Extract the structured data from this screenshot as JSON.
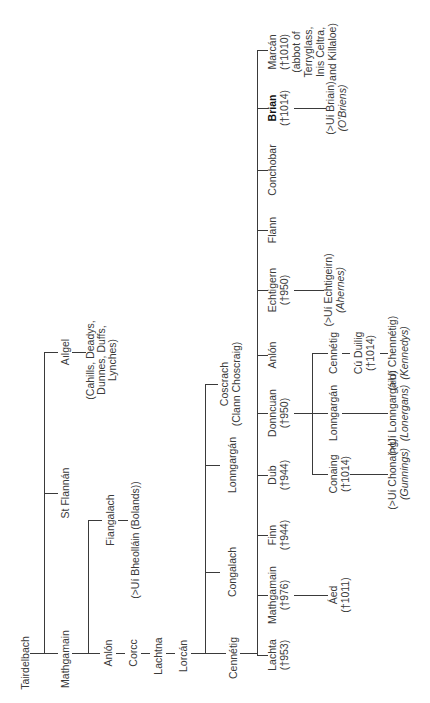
{
  "diagram": {
    "type": "family-tree",
    "orientation": "rotated 90 degrees counter-clockwise",
    "line_color": "#3a3a3a",
    "text_color": "#3a3a3a",
    "background": "#ffffff"
  },
  "nodes": {
    "tairdelbach": {
      "name": "Tairdelbach"
    },
    "mathgamain_1": {
      "name": "Mathgamain"
    },
    "st_flannan": {
      "name": "St Flannán"
    },
    "ailgel": {
      "name": "Aılgel",
      "descendants": [
        "(Cahills, Deadys,",
        "Dunnes, Duffs,",
        "Lynches)"
      ]
    },
    "anlon_1": {
      "name": "Anlón"
    },
    "fiangalach": {
      "name": "Fiangalach",
      "descendants": [
        "(>Uí Bheolláin (Bolands))"
      ]
    },
    "corcc": {
      "name": "Corcc"
    },
    "lachtna": {
      "name": "Lachtna"
    },
    "lorcan": {
      "name": "Lorcán"
    },
    "cennetig_1": {
      "name": "Cennétig"
    },
    "congalach": {
      "name": "Congalach"
    },
    "lonngargan_1": {
      "name": "Lonngargán"
    },
    "coscrach": {
      "name": "Coscrach",
      "note": "(Clann Choscraig)"
    },
    "lachta": {
      "name": "Lachta",
      "dates": "(†953)"
    },
    "mathgamain_2": {
      "name": "Mathgamain",
      "dates": "(†976)"
    },
    "aed": {
      "name": "Áed",
      "dates": "(†1011)"
    },
    "finn": {
      "name": "Finn",
      "dates": "(†944)"
    },
    "dub": {
      "name": "Dub",
      "dates": "(†944)"
    },
    "donncuan": {
      "name": "Donncuan",
      "dates": "(†950)"
    },
    "conaing": {
      "name": "Conaing",
      "dates": "(†1014)",
      "descendants": [
        "(>Uí Chonaing)",
        "(Gunnings)"
      ]
    },
    "lonngargan_2": {
      "name": "Lonngargán",
      "descendants": [
        "(>Uí Lonngargáin)",
        "(Lonergans)"
      ]
    },
    "cennetig_2": {
      "name": "Cennétig"
    },
    "cu_duilig": {
      "name": "Cú Duilig",
      "dates": "(†1014)",
      "descendants": [
        "(>Uí Chennétig)",
        "(Kennedys)"
      ]
    },
    "anlon_2": {
      "name": "Anlón"
    },
    "echtigern": {
      "name": "Echtigern",
      "dates": "(†950)",
      "descendants": [
        "(>Uí Echtigeirn)",
        "(Ahernes)"
      ]
    },
    "flann": {
      "name": "Flann"
    },
    "conchobar": {
      "name": "Conchobar"
    },
    "brian": {
      "name": "Brian",
      "dates": "(†1014)",
      "descendants": [
        "(>Uí Briain)",
        "(O'Briens)"
      ]
    },
    "marcan": {
      "name": "Marcán",
      "dates": "(†1010)",
      "note": [
        "(abbot of",
        "Terryglass,",
        "Inis Celtra,",
        "and Killaloe)"
      ]
    }
  }
}
